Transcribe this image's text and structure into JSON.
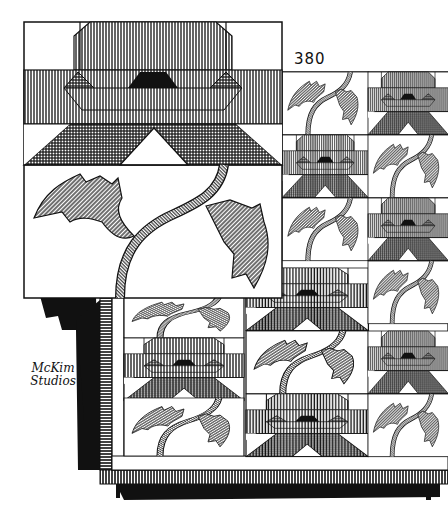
{
  "illustration": {
    "title": "Quilt pattern illustration",
    "pattern_number": "380",
    "signature": {
      "line1": "McKim",
      "line2": "Studios"
    },
    "detail_block": "Enlarged single block: flower with hatched petals over a stem with two leaves",
    "quilt": {
      "rows": 6,
      "visible_columns": 3,
      "layout": "alternating flower and leaf blocks"
    },
    "colors": {
      "ink": "#111111",
      "paper": "#ffffff"
    }
  }
}
